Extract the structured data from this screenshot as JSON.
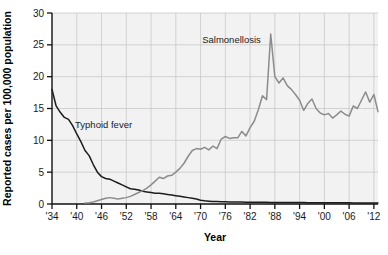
{
  "chart_data": {
    "type": "line",
    "title": "",
    "xlabel": "Year",
    "ylabel": "Reported cases per 100,000 population",
    "xlim": [
      1934,
      2013
    ],
    "ylim": [
      0,
      30
    ],
    "yticks": [
      0,
      5,
      10,
      15,
      20,
      25,
      30
    ],
    "ytick_labels": [
      "0",
      "5",
      "10",
      "15",
      "20",
      "25",
      "30"
    ],
    "xticks": [
      1934,
      1940,
      1946,
      1952,
      1958,
      1964,
      1970,
      1976,
      1982,
      1988,
      1994,
      2000,
      2006,
      2012
    ],
    "xtick_labels": [
      "'34",
      "'40",
      "'46",
      "'52",
      "'58",
      "'64",
      "'70",
      "'76",
      "'82",
      "'88",
      "'94",
      "'00",
      "'06",
      "'12"
    ],
    "grid": true,
    "legend_position": "inline-annotations",
    "annotations": [
      {
        "text": "Typhoid fever",
        "x": 1946.5,
        "y": 12.0
      },
      {
        "text": "Salmonellosis",
        "x": 1977.5,
        "y": 25.3
      }
    ],
    "series": [
      {
        "name": "Typhoid fever",
        "color": "#1c1c1c",
        "x": [
          1934,
          1935,
          1936,
          1937,
          1938,
          1939,
          1940,
          1941,
          1942,
          1943,
          1944,
          1945,
          1946,
          1947,
          1948,
          1949,
          1950,
          1951,
          1952,
          1953,
          1954,
          1955,
          1956,
          1957,
          1958,
          1959,
          1960,
          1961,
          1962,
          1963,
          1964,
          1965,
          1966,
          1967,
          1968,
          1969,
          1970,
          1971,
          1972,
          1973,
          1974,
          1975,
          1976,
          1977,
          1978,
          1979,
          1980,
          1981,
          1982,
          1983,
          1984,
          1985,
          1986,
          1987,
          1988,
          1989,
          1990,
          1991,
          1992,
          1993,
          1994,
          1995,
          1996,
          1997,
          1998,
          1999,
          2000,
          2001,
          2002,
          2003,
          2004,
          2005,
          2006,
          2007,
          2008,
          2009,
          2010,
          2011,
          2012,
          2013
        ],
        "values": [
          18.0,
          15.4,
          14.4,
          13.6,
          13.3,
          12.3,
          11.0,
          9.8,
          8.4,
          7.6,
          6.2,
          5.0,
          4.3,
          4.0,
          3.9,
          3.6,
          3.3,
          3.0,
          2.7,
          2.4,
          2.3,
          2.2,
          2.0,
          1.9,
          1.8,
          1.7,
          1.7,
          1.6,
          1.5,
          1.4,
          1.3,
          1.2,
          1.1,
          1.0,
          0.9,
          0.8,
          0.6,
          0.5,
          0.45,
          0.4,
          0.38,
          0.36,
          0.34,
          0.33,
          0.32,
          0.31,
          0.3,
          0.29,
          0.28,
          0.27,
          0.27,
          0.26,
          0.26,
          0.25,
          0.25,
          0.24,
          0.24,
          0.23,
          0.23,
          0.22,
          0.22,
          0.22,
          0.21,
          0.21,
          0.2,
          0.2,
          0.2,
          0.19,
          0.19,
          0.19,
          0.18,
          0.18,
          0.18,
          0.17,
          0.17,
          0.17,
          0.16,
          0.16,
          0.16,
          0.15
        ]
      },
      {
        "name": "Salmonellosis",
        "color": "#8c8c8c",
        "x": [
          1942,
          1943,
          1944,
          1945,
          1946,
          1947,
          1948,
          1949,
          1950,
          1951,
          1952,
          1953,
          1954,
          1955,
          1956,
          1957,
          1958,
          1959,
          1960,
          1961,
          1962,
          1963,
          1964,
          1965,
          1966,
          1967,
          1968,
          1969,
          1970,
          1971,
          1972,
          1973,
          1974,
          1975,
          1976,
          1977,
          1978,
          1979,
          1980,
          1981,
          1982,
          1983,
          1984,
          1985,
          1986,
          1987,
          1988,
          1989,
          1990,
          1991,
          1992,
          1993,
          1994,
          1995,
          1996,
          1997,
          1998,
          1999,
          2000,
          2001,
          2002,
          2003,
          2004,
          2005,
          2006,
          2007,
          2008,
          2009,
          2010,
          2011,
          2012,
          2013
        ],
        "values": [
          0.15,
          0.2,
          0.3,
          0.5,
          0.7,
          0.9,
          1.0,
          0.9,
          0.8,
          0.9,
          1.0,
          1.2,
          1.5,
          1.8,
          2.1,
          2.5,
          3.0,
          3.6,
          4.2,
          4.0,
          4.4,
          4.5,
          5.0,
          5.6,
          6.4,
          7.5,
          8.4,
          8.7,
          8.6,
          8.9,
          8.5,
          9.1,
          8.7,
          10.2,
          10.6,
          10.3,
          10.4,
          10.4,
          11.4,
          10.7,
          12.0,
          13.0,
          14.8,
          17.0,
          16.4,
          26.7,
          20.0,
          19.0,
          19.8,
          18.6,
          18.0,
          17.2,
          16.3,
          14.7,
          15.8,
          16.5,
          15.0,
          14.3,
          14.0,
          14.2,
          13.5,
          14.0,
          14.6,
          14.1,
          13.8,
          15.4,
          15.0,
          16.3,
          17.6,
          16.0,
          17.2,
          14.5
        ]
      }
    ]
  },
  "axes": {
    "y_title": "Reported cases per 100,000 population",
    "x_title": "Year"
  }
}
